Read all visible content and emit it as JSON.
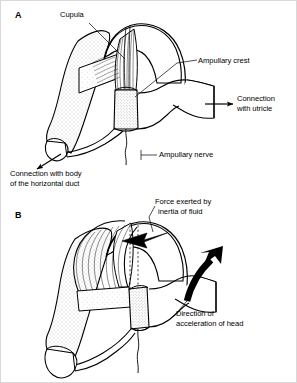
{
  "figure": {
    "background_color": "#ffffff",
    "ink_color": "#000000",
    "stipple_color": "#8a8a8a"
  },
  "panels": [
    {
      "letter": "A",
      "caption_note": "Resting ampulla with cupula upright"
    },
    {
      "letter": "B",
      "caption_note": "Cupula deflected during head acceleration"
    }
  ],
  "labels": {
    "panel_a_letter": "A",
    "panel_b_letter": "B",
    "cupula": "Cupula",
    "ampullary_crest": "Ampullary crest",
    "connection_with_utricle_line1": "Connection",
    "connection_with_utricle_line2": "with utricle",
    "ampullary_nerve": "Ampullary nerve",
    "connection_with_body_line1": "Connection with body",
    "connection_with_body_line2": "of the horizontal duct",
    "force_inertia_line1": "Force exerted by",
    "force_inertia_line2": "inertia of fluid",
    "direction_accel_line1": "Direction of",
    "direction_accel_line2": "acceleration of head"
  },
  "annotations": {
    "leader_lines": [
      "cupula-to-cupula-fibers",
      "ampullary-crest-to-crest",
      "ampullary-nerve-to-nerve"
    ],
    "arrows": [
      "utricle-direction-arrow",
      "horizontal-duct-direction-arrow",
      "fluid-inertia-force-arrow",
      "head-acceleration-curved-arrow"
    ]
  }
}
